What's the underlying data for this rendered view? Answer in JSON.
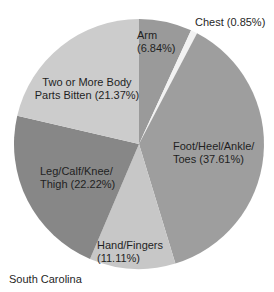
{
  "chart_data": {
    "type": "pie",
    "title": "",
    "footer": "South Carolina",
    "legend": "none",
    "direction": "clockwise",
    "start_angle_deg": 0,
    "background": "#ffffff",
    "label_color": "#1f1f1f",
    "slices": [
      {
        "name": "Arm",
        "value": 6.84,
        "label": "Arm\n(6.84%)",
        "color": "#9a9a9a"
      },
      {
        "name": "Chest",
        "value": 0.85,
        "label": "Chest (0.85%)",
        "color": "#f2f2f2"
      },
      {
        "name": "Foot/Heel/Ankle/Toes",
        "value": 37.61,
        "label": "Foot/Heel/Ankle/\nToes (37.61%)",
        "color": "#9e9e9e"
      },
      {
        "name": "Hand/Fingers",
        "value": 11.11,
        "label": "Hand/Fingers\n(11.11%)",
        "color": "#c7c7c7"
      },
      {
        "name": "Leg/Calf/Knee/Thigh",
        "value": 22.22,
        "label": "Leg/Calf/Knee/\nThigh (22.22%)",
        "color": "#878787"
      },
      {
        "name": "Two or More Body Parts Bitten",
        "value": 21.37,
        "label": "Two or More Body\nParts Bitten (21.37%)",
        "color": "#cccccc"
      }
    ]
  }
}
